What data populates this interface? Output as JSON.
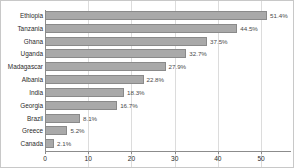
{
  "chart_data": {
    "type": "bar",
    "orientation": "horizontal",
    "title": "",
    "xlabel": "",
    "ylabel": "",
    "xlim": [
      0,
      56
    ],
    "grid": true,
    "legend": null,
    "xticks": [
      0,
      10,
      20,
      30,
      40,
      50
    ],
    "categories": [
      "Ethiopia",
      "Tanzania",
      "Ghana",
      "Uganda",
      "Madagascar",
      "Albania",
      "India",
      "Georgia",
      "Brazil",
      "Greece",
      "Canada"
    ],
    "values": [
      51.4,
      44.5,
      37.5,
      32.7,
      27.9,
      22.8,
      18.3,
      16.7,
      8.1,
      5.2,
      2.1
    ],
    "value_labels": [
      "51.4%",
      "44.5%",
      "37.5%",
      "32.7%",
      "27.9%",
      "22.8%",
      "18.3%",
      "16.7%",
      "8.1%",
      "5.2%",
      "2.1%"
    ],
    "colors": {
      "bar_fill": "#a9a9a9",
      "bar_border": "#8a8a8a",
      "gridline": "#dcdcdc",
      "axis": "#8c8c8c",
      "text": "#2b2b2b",
      "background": "#ffffff",
      "frame": "#c8c8c8"
    }
  }
}
